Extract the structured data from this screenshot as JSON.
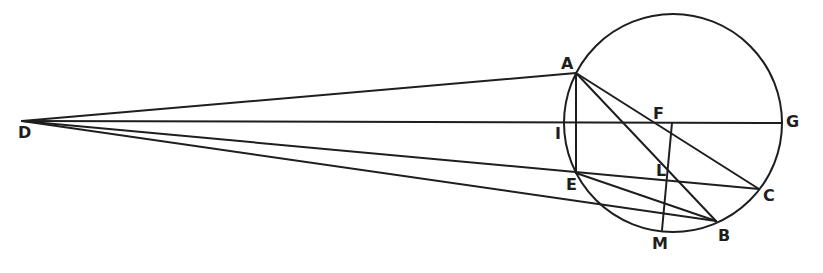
{
  "diagram": {
    "type": "geometric-construction",
    "stroke_color": "#1e1e1e",
    "background": "#ffffff",
    "circle": {
      "cx": 673,
      "cy": 123,
      "r": 109
    },
    "points": {
      "D": [
        22,
        121
      ],
      "A": [
        576,
        73
      ],
      "G": [
        782,
        123
      ],
      "I": [
        564,
        123
      ],
      "F": [
        655,
        123
      ],
      "E": [
        576,
        173
      ],
      "L": [
        668,
        176
      ],
      "C": [
        759,
        189
      ],
      "B": [
        716,
        221
      ],
      "M": [
        662,
        230
      ]
    },
    "segments": [
      [
        "D",
        "A"
      ],
      [
        "D",
        "G"
      ],
      [
        "D",
        "C"
      ],
      [
        "D",
        "B"
      ],
      [
        "A",
        "E"
      ],
      [
        "A",
        "B"
      ],
      [
        "A",
        "C"
      ],
      [
        "E",
        "B"
      ],
      [
        "F2",
        "M"
      ]
    ],
    "extra_points": {
      "F2": [
        672,
        123
      ]
    },
    "labels": [
      {
        "text": "D",
        "x": 18,
        "y": 125
      },
      {
        "text": "A",
        "x": 561,
        "y": 56
      },
      {
        "text": "G",
        "x": 786,
        "y": 114
      },
      {
        "text": "I",
        "x": 555,
        "y": 126
      },
      {
        "text": "F",
        "x": 653,
        "y": 106
      },
      {
        "text": "E",
        "x": 566,
        "y": 177
      },
      {
        "text": "L",
        "x": 656,
        "y": 163
      },
      {
        "text": "C",
        "x": 763,
        "y": 188
      },
      {
        "text": "B",
        "x": 718,
        "y": 228
      },
      {
        "text": "M",
        "x": 652,
        "y": 236
      }
    ]
  }
}
